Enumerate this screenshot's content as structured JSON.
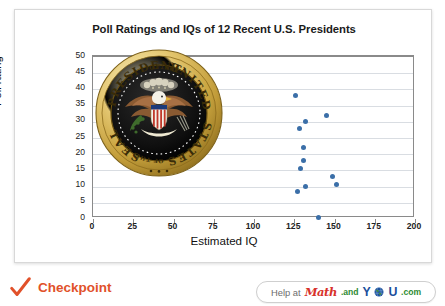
{
  "chart_data": {
    "type": "scatter",
    "title": "Poll Ratings and IQs of 12 Recent U.S. Presidents",
    "xlabel": "Estimated IQ",
    "ylabel": "Poll rating",
    "xlim": [
      0,
      200
    ],
    "ylim": [
      0,
      50
    ],
    "xticks": [
      "0",
      "25",
      "50",
      "75",
      "100",
      "125",
      "150",
      "175",
      "200"
    ],
    "yticks": [
      "0",
      "5",
      "10",
      "15",
      "20",
      "25",
      "30",
      "35",
      "40",
      "45",
      "50"
    ],
    "grid": "horizontal",
    "legend": "none",
    "series": [
      {
        "name": "Presidents",
        "point_color": "#3b6fa8",
        "points": [
          {
            "x": 126,
            "y": 38
          },
          {
            "x": 132,
            "y": 30
          },
          {
            "x": 128,
            "y": 28
          },
          {
            "x": 145,
            "y": 32
          },
          {
            "x": 131,
            "y": 22
          },
          {
            "x": 131,
            "y": 18
          },
          {
            "x": 129,
            "y": 15.5
          },
          {
            "x": 149,
            "y": 13
          },
          {
            "x": 151,
            "y": 10.5
          },
          {
            "x": 132,
            "y": 10
          },
          {
            "x": 127,
            "y": 8.5
          },
          {
            "x": 140,
            "y": 0.5
          }
        ]
      }
    ]
  },
  "figure": {
    "overlay_image": "presidential-seal",
    "overlay_alt": "Seal of the President of the United States"
  },
  "footer": {
    "checkpoint_label": "Checkpoint",
    "check_icon": "check-icon",
    "help_prefix": "Help at",
    "logo": {
      "math": "Math",
      "and": ".and",
      "y": "Y",
      "globe": "globe-icon",
      "u": "U",
      "com": ".com"
    }
  },
  "colors": {
    "accent": "#e1512a",
    "point": "#3b6fa8",
    "grid": "#d9dde2",
    "axis": "#8a8a8a",
    "logo_red": "#d8322b",
    "logo_green": "#2e8b33",
    "logo_blue": "#1b4f9c"
  }
}
